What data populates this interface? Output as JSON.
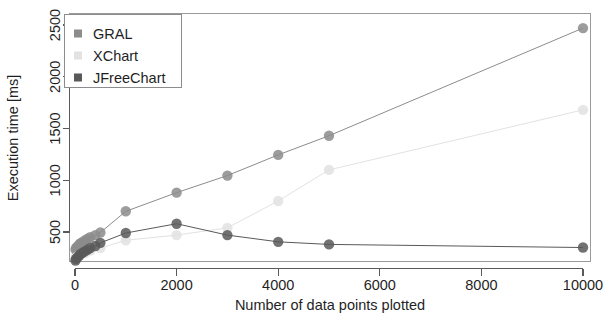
{
  "chart_data": {
    "type": "scatter",
    "title": "",
    "xlabel": "Number of data points plotted",
    "ylabel": "Execution time [ms]",
    "xlim": [
      -300,
      10600
    ],
    "ylim": [
      130,
      2620
    ],
    "xticks": [
      0,
      2000,
      4000,
      6000,
      8000,
      10000
    ],
    "xticklabels": [
      "0",
      "2000",
      "4000",
      "6000",
      "8000",
      "10000"
    ],
    "yticks": [
      500,
      1000,
      1500,
      2000,
      2500
    ],
    "yticklabels": [
      "500",
      "1000",
      "1500",
      "2000",
      "2500"
    ],
    "grid": false,
    "legend_position": "top-left",
    "markers": "filled-circle",
    "connected": true,
    "series": [
      {
        "name": "GRAL",
        "color": "#8c8c8c",
        "x": [
          10,
          20,
          50,
          80,
          100,
          150,
          200,
          250,
          300,
          400,
          500,
          1000,
          2000,
          3000,
          4000,
          5000,
          10000
        ],
        "y": [
          330,
          345,
          360,
          375,
          390,
          405,
          420,
          435,
          450,
          470,
          495,
          700,
          880,
          1045,
          1245,
          1430,
          2470
        ]
      },
      {
        "name": "XChart",
        "color": "#e2e2e2",
        "x": [
          10,
          50,
          100,
          200,
          300,
          500,
          1000,
          2000,
          3000,
          4000,
          5000,
          10000
        ],
        "y": [
          250,
          265,
          280,
          300,
          320,
          345,
          420,
          470,
          540,
          800,
          1100,
          1680
        ]
      },
      {
        "name": "JFreeChart",
        "color": "#595959",
        "x": [
          10,
          20,
          50,
          80,
          100,
          150,
          200,
          250,
          300,
          400,
          500,
          1000,
          2000,
          3000,
          4000,
          5000,
          10000
        ],
        "y": [
          225,
          240,
          255,
          270,
          285,
          300,
          315,
          330,
          345,
          365,
          395,
          490,
          580,
          470,
          405,
          380,
          350
        ]
      }
    ],
    "legend_entries": [
      {
        "label": "GRAL",
        "color": "#8c8c8c"
      },
      {
        "label": "XChart",
        "color": "#e2e2e2"
      },
      {
        "label": "JFreeChart",
        "color": "#595959"
      }
    ]
  }
}
